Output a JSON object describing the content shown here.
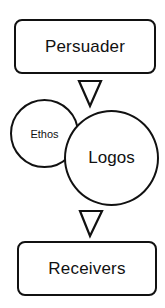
{
  "diagram": {
    "nodes": [
      {
        "id": "persuader",
        "label": "Persuader",
        "shape": "rounded-rectangle"
      },
      {
        "id": "ethos",
        "label": "Ethos",
        "shape": "circle"
      },
      {
        "id": "logos",
        "label": "Logos",
        "shape": "circle"
      },
      {
        "id": "receivers",
        "label": "Receivers",
        "shape": "rounded-rectangle"
      }
    ],
    "arrows": [
      {
        "from": "persuader",
        "to": "ethos-logos",
        "icon": "triangle-down-arrow"
      },
      {
        "from": "ethos-logos",
        "to": "receivers",
        "icon": "triangle-down-arrow"
      }
    ],
    "colors": {
      "stroke": "#111111",
      "fill": "#ffffff"
    }
  }
}
